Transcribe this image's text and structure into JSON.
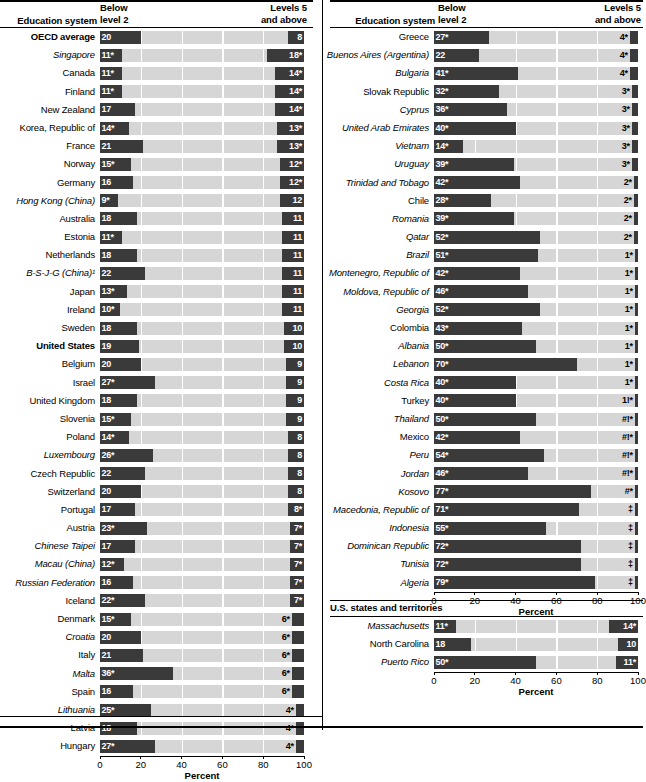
{
  "headers": {
    "education_system": "Education system",
    "below_level_2": "Below\nlevel 2",
    "below_level_2_l1": "Below",
    "below_level_2_l2": "level 2",
    "levels_5_l1": "Levels 5",
    "levels_5_l2": "and above",
    "us_states": "U.S. states and territories"
  },
  "axis": {
    "title": "Percent",
    "ticks": [
      "0",
      "20",
      "40",
      "60",
      "80",
      "100"
    ],
    "tick_values": [
      0,
      20,
      40,
      60,
      80,
      100
    ],
    "min": 0,
    "max": 100
  },
  "colors": {
    "bar_dark": "#3a3a3a",
    "track_light": "#d6d6d6",
    "text": "#000000",
    "label_on_bar": "#ffffff"
  },
  "chart_data": {
    "type": "bar",
    "subtype": "paired-stacked-horizontal",
    "xlabel": "Percent",
    "ylabel": "Education system",
    "xlim": [
      0,
      100
    ],
    "grid": false,
    "legend_position": "top",
    "series": [
      {
        "name": "Below level 2",
        "label": "Below level 2",
        "align": "left"
      },
      {
        "name": "Levels 5 and above",
        "label": "Levels 5 and above",
        "align": "right"
      }
    ],
    "panels": [
      {
        "id": "panel-left",
        "categories": [
          "OECD average",
          "Singapore",
          "Canada",
          "Finland",
          "New Zealand",
          "Korea, Republic of",
          "France",
          "Norway",
          "Germany",
          "Hong Kong (China)",
          "Australia",
          "Estonia",
          "Netherlands",
          "B-S-J-G (China)¹",
          "Japan",
          "Ireland",
          "Sweden",
          "United States",
          "Belgium",
          "Israel",
          "United Kingdom",
          "Slovenia",
          "Poland",
          "Luxembourg",
          "Czech Republic",
          "Switzerland",
          "Portugal",
          "Austria",
          "Chinese Taipei",
          "Macau (China)",
          "Russian Federation",
          "Iceland",
          "Denmark",
          "Croatia",
          "Italy",
          "Malta",
          "Spain",
          "Lithuania",
          "Latvia",
          "Hungary"
        ],
        "rows": [
          {
            "label": "OECD average",
            "style": "bold",
            "below": 20,
            "below_text": "20",
            "above": 8,
            "above_text": "8"
          },
          {
            "label": "Singapore",
            "style": "italic",
            "below": 11,
            "below_text": "11*",
            "above": 18,
            "above_text": "18*"
          },
          {
            "label": "Canada",
            "style": "normal",
            "below": 11,
            "below_text": "11*",
            "above": 14,
            "above_text": "14*"
          },
          {
            "label": "Finland",
            "style": "normal",
            "below": 11,
            "below_text": "11*",
            "above": 14,
            "above_text": "14*"
          },
          {
            "label": "New Zealand",
            "style": "normal",
            "below": 17,
            "below_text": "17",
            "above": 14,
            "above_text": "14*"
          },
          {
            "label": "Korea, Republic of",
            "style": "normal",
            "below": 14,
            "below_text": "14*",
            "above": 13,
            "above_text": "13*"
          },
          {
            "label": "France",
            "style": "normal",
            "below": 21,
            "below_text": "21",
            "above": 13,
            "above_text": "13*"
          },
          {
            "label": "Norway",
            "style": "normal",
            "below": 15,
            "below_text": "15*",
            "above": 12,
            "above_text": "12*"
          },
          {
            "label": "Germany",
            "style": "normal",
            "below": 16,
            "below_text": "16",
            "above": 12,
            "above_text": "12*"
          },
          {
            "label": "Hong Kong (China)",
            "style": "italic",
            "below": 9,
            "below_text": "9*",
            "above": 12,
            "above_text": "12"
          },
          {
            "label": "Australia",
            "style": "normal",
            "below": 18,
            "below_text": "18",
            "above": 11,
            "above_text": "11"
          },
          {
            "label": "Estonia",
            "style": "normal",
            "below": 11,
            "below_text": "11*",
            "above": 11,
            "above_text": "11"
          },
          {
            "label": "Netherlands",
            "style": "normal",
            "below": 18,
            "below_text": "18",
            "above": 11,
            "above_text": "11"
          },
          {
            "label": "B-S-J-G (China)¹",
            "style": "italic",
            "below": 22,
            "below_text": "22",
            "above": 11,
            "above_text": "11"
          },
          {
            "label": "Japan",
            "style": "normal",
            "below": 13,
            "below_text": "13*",
            "above": 11,
            "above_text": "11"
          },
          {
            "label": "Ireland",
            "style": "normal",
            "below": 10,
            "below_text": "10*",
            "above": 11,
            "above_text": "11"
          },
          {
            "label": "Sweden",
            "style": "normal",
            "below": 18,
            "below_text": "18",
            "above": 10,
            "above_text": "10"
          },
          {
            "label": "United States",
            "style": "bold",
            "below": 19,
            "below_text": "19",
            "above": 10,
            "above_text": "10"
          },
          {
            "label": "Belgium",
            "style": "normal",
            "below": 20,
            "below_text": "20",
            "above": 9,
            "above_text": "9"
          },
          {
            "label": "Israel",
            "style": "normal",
            "below": 27,
            "below_text": "27*",
            "above": 9,
            "above_text": "9"
          },
          {
            "label": "United Kingdom",
            "style": "normal",
            "below": 18,
            "below_text": "18",
            "above": 9,
            "above_text": "9"
          },
          {
            "label": "Slovenia",
            "style": "normal",
            "below": 15,
            "below_text": "15*",
            "above": 9,
            "above_text": "9"
          },
          {
            "label": "Poland",
            "style": "normal",
            "below": 14,
            "below_text": "14*",
            "above": 8,
            "above_text": "8"
          },
          {
            "label": "Luxembourg",
            "style": "italic",
            "below": 26,
            "below_text": "26*",
            "above": 8,
            "above_text": "8"
          },
          {
            "label": "Czech Republic",
            "style": "normal",
            "below": 22,
            "below_text": "22",
            "above": 8,
            "above_text": "8"
          },
          {
            "label": "Switzerland",
            "style": "normal",
            "below": 20,
            "below_text": "20",
            "above": 8,
            "above_text": "8"
          },
          {
            "label": "Portugal",
            "style": "normal",
            "below": 17,
            "below_text": "17",
            "above": 8,
            "above_text": "8*"
          },
          {
            "label": "Austria",
            "style": "normal",
            "below": 23,
            "below_text": "23*",
            "above": 7,
            "above_text": "7*"
          },
          {
            "label": "Chinese Taipei",
            "style": "italic",
            "below": 17,
            "below_text": "17",
            "above": 7,
            "above_text": "7*"
          },
          {
            "label": "Macau (China)",
            "style": "italic",
            "below": 12,
            "below_text": "12*",
            "above": 7,
            "above_text": "7*"
          },
          {
            "label": "Russian Federation",
            "style": "italic",
            "below": 16,
            "below_text": "16",
            "above": 7,
            "above_text": "7*"
          },
          {
            "label": "Iceland",
            "style": "normal",
            "below": 22,
            "below_text": "22*",
            "above": 7,
            "above_text": "7*"
          },
          {
            "label": "Denmark",
            "style": "normal",
            "below": 15,
            "below_text": "15*",
            "above": 6,
            "above_text": "6*"
          },
          {
            "label": "Croatia",
            "style": "italic",
            "below": 20,
            "below_text": "20",
            "above": 6,
            "above_text": "6*"
          },
          {
            "label": "Italy",
            "style": "normal",
            "below": 21,
            "below_text": "21",
            "above": 6,
            "above_text": "6*"
          },
          {
            "label": "Malta",
            "style": "italic",
            "below": 36,
            "below_text": "36*",
            "above": 6,
            "above_text": "6*"
          },
          {
            "label": "Spain",
            "style": "normal",
            "below": 16,
            "below_text": "16",
            "above": 6,
            "above_text": "6*"
          },
          {
            "label": "Lithuania",
            "style": "italic",
            "below": 25,
            "below_text": "25*",
            "above": 4,
            "above_text": "4*"
          },
          {
            "label": "Latvia",
            "style": "normal",
            "below": 18,
            "below_text": "18",
            "above": 4,
            "above_text": "4*"
          },
          {
            "label": "Hungary",
            "style": "normal",
            "below": 27,
            "below_text": "27*",
            "above": 4,
            "above_text": "4*"
          }
        ]
      },
      {
        "id": "panel-right",
        "rows": [
          {
            "label": "Greece",
            "style": "normal",
            "below": 27,
            "below_text": "27*",
            "above": 4,
            "above_text": "4*"
          },
          {
            "label": "Buenos Aires (Argentina)",
            "style": "italic",
            "below": 22,
            "below_text": "22",
            "above": 4,
            "above_text": "4*"
          },
          {
            "label": "Bulgaria",
            "style": "italic",
            "below": 41,
            "below_text": "41*",
            "above": 4,
            "above_text": "4*"
          },
          {
            "label": "Slovak Republic",
            "style": "normal",
            "below": 32,
            "below_text": "32*",
            "above": 3,
            "above_text": "3*"
          },
          {
            "label": "Cyprus",
            "style": "italic",
            "below": 36,
            "below_text": "36*",
            "above": 3,
            "above_text": "3*"
          },
          {
            "label": "United Arab Emirates",
            "style": "italic",
            "below": 40,
            "below_text": "40*",
            "above": 3,
            "above_text": "3*"
          },
          {
            "label": "Vietnam",
            "style": "italic",
            "below": 14,
            "below_text": "14*",
            "above": 3,
            "above_text": "3*"
          },
          {
            "label": "Uruguay",
            "style": "italic",
            "below": 39,
            "below_text": "39*",
            "above": 3,
            "above_text": "3*"
          },
          {
            "label": "Trinidad and Tobago",
            "style": "italic",
            "below": 42,
            "below_text": "42*",
            "above": 2,
            "above_text": "2*"
          },
          {
            "label": "Chile",
            "style": "normal",
            "below": 28,
            "below_text": "28*",
            "above": 2,
            "above_text": "2*"
          },
          {
            "label": "Romania",
            "style": "italic",
            "below": 39,
            "below_text": "39*",
            "above": 2,
            "above_text": "2*"
          },
          {
            "label": "Qatar",
            "style": "italic",
            "below": 52,
            "below_text": "52*",
            "above": 2,
            "above_text": "2*"
          },
          {
            "label": "Brazil",
            "style": "italic",
            "below": 51,
            "below_text": "51*",
            "above": 1,
            "above_text": "1*"
          },
          {
            "label": "Montenegro, Republic of",
            "style": "italic",
            "below": 42,
            "below_text": "42*",
            "above": 1,
            "above_text": "1*"
          },
          {
            "label": "Moldova, Republic of",
            "style": "italic",
            "below": 46,
            "below_text": "46*",
            "above": 1,
            "above_text": "1*"
          },
          {
            "label": "Georgia",
            "style": "italic",
            "below": 52,
            "below_text": "52*",
            "above": 1,
            "above_text": "1*"
          },
          {
            "label": "Colombia",
            "style": "normal",
            "below": 43,
            "below_text": "43*",
            "above": 1,
            "above_text": "1*"
          },
          {
            "label": "Albania",
            "style": "italic",
            "below": 50,
            "below_text": "50*",
            "above": 1,
            "above_text": "1*"
          },
          {
            "label": "Lebanon",
            "style": "italic",
            "below": 70,
            "below_text": "70*",
            "above": 1,
            "above_text": "1*"
          },
          {
            "label": "Costa Rica",
            "style": "italic",
            "below": 40,
            "below_text": "40*",
            "above": 1,
            "above_text": "1*"
          },
          {
            "label": "Turkey",
            "style": "normal",
            "below": 40,
            "below_text": "40*",
            "above": 1,
            "above_text": "1!*"
          },
          {
            "label": "Thailand",
            "style": "italic",
            "below": 50,
            "below_text": "50*",
            "above": 0.4,
            "above_text": "#!*"
          },
          {
            "label": "Mexico",
            "style": "normal",
            "below": 42,
            "below_text": "42*",
            "above": 0.4,
            "above_text": "#!*"
          },
          {
            "label": "Peru",
            "style": "italic",
            "below": 54,
            "below_text": "54*",
            "above": 0.4,
            "above_text": "#!*"
          },
          {
            "label": "Jordan",
            "style": "italic",
            "below": 46,
            "below_text": "46*",
            "above": 0.4,
            "above_text": "#!*"
          },
          {
            "label": "Kosovo",
            "style": "italic",
            "below": 77,
            "below_text": "77*",
            "above": 0.3,
            "above_text": "#*"
          },
          {
            "label": "Macedonia, Republic of",
            "style": "italic",
            "below": 71,
            "below_text": "71*",
            "above": 0,
            "above_text": "‡"
          },
          {
            "label": "Indonesia",
            "style": "italic",
            "below": 55,
            "below_text": "55*",
            "above": 0,
            "above_text": "‡"
          },
          {
            "label": "Dominican Republic",
            "style": "italic",
            "below": 72,
            "below_text": "72*",
            "above": 0,
            "above_text": "‡"
          },
          {
            "label": "Tunisia",
            "style": "italic",
            "below": 72,
            "below_text": "72*",
            "above": 0,
            "above_text": "‡"
          },
          {
            "label": "Algeria",
            "style": "italic",
            "below": 79,
            "below_text": "79*",
            "above": 0,
            "above_text": "‡"
          }
        ]
      },
      {
        "id": "panel-us",
        "rows": [
          {
            "label": "Massachusetts",
            "style": "italic",
            "below": 11,
            "below_text": "11*",
            "above": 14,
            "above_text": "14*"
          },
          {
            "label": "North Carolina",
            "style": "normal",
            "below": 18,
            "below_text": "18",
            "above": 10,
            "above_text": "10"
          },
          {
            "label": "Puerto Rico",
            "style": "italic",
            "below": 50,
            "below_text": "50*",
            "above": 11,
            "above_text": "11*"
          }
        ]
      }
    ]
  }
}
